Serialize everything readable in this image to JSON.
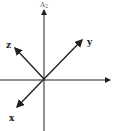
{
  "diagram": {
    "type": "coordinate-axes",
    "vertical_axis_label": "A",
    "vertical_axis_subscript": "2",
    "vectors": [
      {
        "name": "y",
        "label": "y"
      },
      {
        "name": "z",
        "label": "z"
      },
      {
        "name": "x",
        "label": "x"
      }
    ],
    "colors": {
      "stroke": "#222222",
      "background": "#ffffff"
    }
  }
}
